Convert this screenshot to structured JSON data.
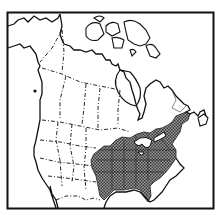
{
  "map": {
    "type": "range-map",
    "region": "North America",
    "style": "black-and-white line map with stippled range fill",
    "colors": {
      "background": "#ffffff",
      "lines": "#111111",
      "range_fill": "#7a7a7a"
    },
    "layers": {
      "frame": "map-frame",
      "coastline": "coastline",
      "borders": "political boundaries (dashed)",
      "range": "shaded range: eastern United States"
    }
  }
}
